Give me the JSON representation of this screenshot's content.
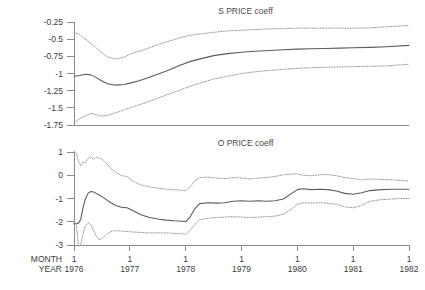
{
  "chart_data": [
    {
      "type": "line",
      "title": "S PRICE coeff",
      "panel": "top",
      "xlabel": "",
      "ylabel": "",
      "xlim": [
        1976.0,
        1982.0
      ],
      "ylim": [
        -1.75,
        -0.25
      ],
      "grid": false,
      "legend": "none",
      "xticks": [
        1976,
        1977,
        1978,
        1979,
        1980,
        1981,
        1982
      ],
      "xtick_labels": [
        "1976",
        "1977",
        "1978",
        "1979",
        "1980",
        "1981",
        "1982"
      ],
      "yticks": [
        -0.25,
        -0.5,
        -0.75,
        -1,
        -1.25,
        -1.5,
        -1.75
      ],
      "ytick_labels": [
        "-0.25",
        "-0.5",
        "-0.75",
        "-1",
        "-1.25",
        "-1.5",
        "-1.75"
      ],
      "x": [
        1976.0,
        1976.1,
        1976.2,
        1976.3,
        1976.4,
        1976.5,
        1976.6,
        1976.75,
        1976.9,
        1977.0,
        1977.15,
        1977.3,
        1977.5,
        1977.7,
        1977.9,
        1978.1,
        1978.3,
        1978.5,
        1978.75,
        1979.0,
        1979.25,
        1979.5,
        1979.75,
        1980.0,
        1980.25,
        1980.5,
        1980.75,
        1981.0,
        1981.3,
        1981.6,
        1982.0
      ],
      "series": [
        {
          "name": "upper band",
          "style": "dotted",
          "values": [
            -0.4,
            -0.43,
            -0.5,
            -0.56,
            -0.63,
            -0.7,
            -0.76,
            -0.79,
            -0.76,
            -0.72,
            -0.68,
            -0.64,
            -0.58,
            -0.53,
            -0.48,
            -0.44,
            -0.42,
            -0.4,
            -0.38,
            -0.37,
            -0.36,
            -0.35,
            -0.345,
            -0.34,
            -0.34,
            -0.34,
            -0.34,
            -0.34,
            -0.335,
            -0.32,
            -0.3
          ]
        },
        {
          "name": "coefficient estimate",
          "style": "solid",
          "values": [
            -1.04,
            -1.03,
            -1.01,
            -1.02,
            -1.06,
            -1.11,
            -1.15,
            -1.17,
            -1.16,
            -1.14,
            -1.11,
            -1.07,
            -1.01,
            -0.95,
            -0.88,
            -0.82,
            -0.78,
            -0.74,
            -0.71,
            -0.69,
            -0.675,
            -0.665,
            -0.655,
            -0.645,
            -0.64,
            -0.635,
            -0.63,
            -0.625,
            -0.62,
            -0.61,
            -0.59
          ]
        },
        {
          "name": "lower band",
          "style": "dotted",
          "values": [
            -1.72,
            -1.66,
            -1.62,
            -1.58,
            -1.6,
            -1.62,
            -1.61,
            -1.57,
            -1.53,
            -1.5,
            -1.46,
            -1.42,
            -1.36,
            -1.3,
            -1.24,
            -1.18,
            -1.13,
            -1.08,
            -1.04,
            -1.0,
            -0.975,
            -0.955,
            -0.94,
            -0.925,
            -0.915,
            -0.91,
            -0.905,
            -0.9,
            -0.895,
            -0.89,
            -0.865
          ]
        }
      ]
    },
    {
      "type": "line",
      "title": "O PRICE coeff",
      "panel": "bottom",
      "xlabel": "",
      "ylabel": "",
      "xlim": [
        1976.0,
        1982.0
      ],
      "ylim": [
        -3.0,
        1.0
      ],
      "grid": false,
      "legend": "none",
      "xticks": [
        1976,
        1977,
        1978,
        1979,
        1980,
        1981,
        1982
      ],
      "xtick_labels": [
        "1976",
        "1977",
        "1978",
        "1979",
        "1980",
        "1981",
        "1982"
      ],
      "xtick_months": [
        "1",
        "1",
        "1",
        "1",
        "1",
        "1",
        "1"
      ],
      "yticks": [
        1,
        0,
        -1,
        -2,
        -3
      ],
      "ytick_labels": [
        "1",
        "0",
        "-1",
        "-2",
        "-3"
      ],
      "x": [
        1976.0,
        1976.04,
        1976.08,
        1976.12,
        1976.16,
        1976.2,
        1976.25,
        1976.3,
        1976.35,
        1976.4,
        1976.45,
        1976.5,
        1976.58,
        1976.66,
        1976.75,
        1976.85,
        1976.95,
        1977.05,
        1977.2,
        1977.35,
        1977.5,
        1977.65,
        1977.8,
        1977.95,
        1978.0,
        1978.08,
        1978.16,
        1978.25,
        1978.4,
        1978.55,
        1978.7,
        1978.85,
        1979.0,
        1979.15,
        1979.3,
        1979.45,
        1979.6,
        1979.75,
        1979.9,
        1980.0,
        1980.1,
        1980.25,
        1980.4,
        1980.55,
        1980.7,
        1980.85,
        1981.0,
        1981.15,
        1981.3,
        1981.5,
        1981.7,
        1981.85,
        1982.0
      ],
      "series": [
        {
          "name": "upper band",
          "style": "dotted",
          "values": [
            1.05,
            0.95,
            0.62,
            0.4,
            0.58,
            0.52,
            0.72,
            0.8,
            0.68,
            0.78,
            0.74,
            0.7,
            0.52,
            0.3,
            0.12,
            -0.02,
            -0.05,
            -0.25,
            -0.42,
            -0.5,
            -0.55,
            -0.6,
            -0.62,
            -0.65,
            -0.66,
            -0.5,
            -0.25,
            -0.1,
            -0.08,
            -0.12,
            -0.15,
            -0.1,
            -0.12,
            -0.16,
            -0.12,
            -0.1,
            -0.05,
            0.02,
            0.05,
            0.06,
            0.0,
            -0.02,
            0.02,
            0.03,
            -0.02,
            -0.1,
            -0.14,
            -0.2,
            -0.16,
            -0.18,
            -0.2,
            -0.22,
            -0.25
          ]
        },
        {
          "name": "coefficient estimate",
          "style": "solid",
          "values": [
            -2.08,
            -2.08,
            -2.06,
            -1.9,
            -1.4,
            -1.05,
            -0.78,
            -0.7,
            -0.72,
            -0.78,
            -0.85,
            -0.92,
            -1.05,
            -1.18,
            -1.3,
            -1.38,
            -1.4,
            -1.52,
            -1.7,
            -1.82,
            -1.88,
            -1.93,
            -1.96,
            -1.98,
            -1.99,
            -1.8,
            -1.45,
            -1.22,
            -1.18,
            -1.2,
            -1.18,
            -1.12,
            -1.1,
            -1.12,
            -1.1,
            -1.12,
            -1.1,
            -1.02,
            -0.78,
            -0.62,
            -0.58,
            -0.62,
            -0.6,
            -0.62,
            -0.68,
            -0.78,
            -0.82,
            -0.75,
            -0.66,
            -0.62,
            -0.6,
            -0.6,
            -0.6
          ]
        },
        {
          "name": "lower band",
          "style": "dotted",
          "values": [
            -2.05,
            -2.06,
            -3.05,
            -3.0,
            -2.55,
            -2.2,
            -2.05,
            -2.12,
            -2.38,
            -2.62,
            -2.78,
            -2.72,
            -2.55,
            -2.42,
            -2.38,
            -2.4,
            -2.42,
            -2.44,
            -2.46,
            -2.48,
            -2.48,
            -2.48,
            -2.5,
            -2.52,
            -2.54,
            -2.38,
            -2.12,
            -1.92,
            -1.85,
            -1.82,
            -1.8,
            -1.78,
            -1.8,
            -1.82,
            -1.8,
            -1.78,
            -1.76,
            -1.68,
            -1.45,
            -1.25,
            -1.18,
            -1.2,
            -1.18,
            -1.2,
            -1.25,
            -1.36,
            -1.4,
            -1.3,
            -1.12,
            -1.05,
            -1.02,
            -1.0,
            -1.0
          ]
        }
      ]
    }
  ],
  "axis_corner": {
    "month_label": "MONTH",
    "year_label": "YEAR"
  },
  "colors": {
    "axis": "#8a8a8a",
    "center_line": "#5c5c5c",
    "band_line": "#9a9a9a",
    "text": "#3d3d3d",
    "background": "#ffffff"
  }
}
